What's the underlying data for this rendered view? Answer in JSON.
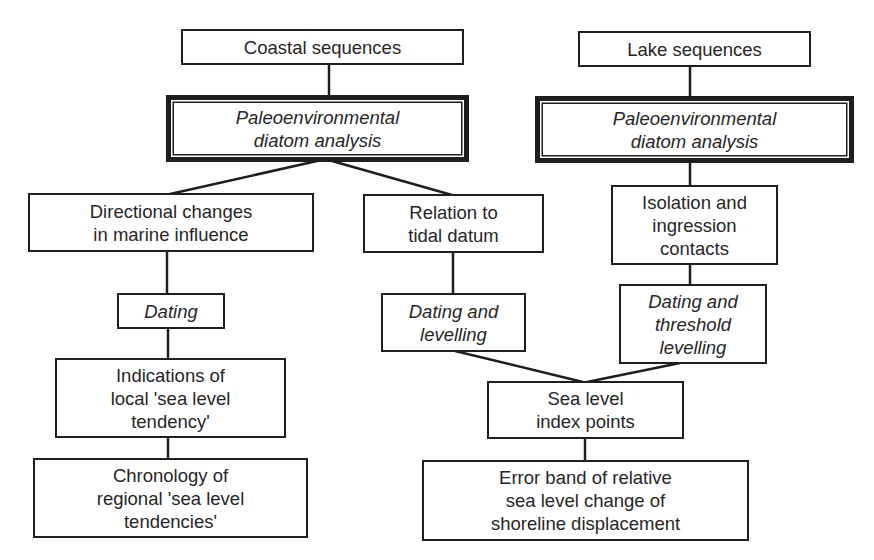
{
  "diagram": {
    "type": "flowchart",
    "nodes": {
      "coastal": {
        "label": "Coastal sequences",
        "style": "normal"
      },
      "lake": {
        "label": "Lake sequences",
        "style": "normal"
      },
      "paleo_left": {
        "label": "Paleoenvironmental\ndiatom analysis",
        "style": "italic-double-border"
      },
      "paleo_right": {
        "label": "Paleoenvironmental\ndiatom analysis",
        "style": "italic-double-border"
      },
      "directional": {
        "label": "Directional changes\nin marine influence",
        "style": "normal"
      },
      "tidal": {
        "label": "Relation to\ntidal datum",
        "style": "normal"
      },
      "isolation": {
        "label": "Isolation and\ningression\ncontacts",
        "style": "normal"
      },
      "dating": {
        "label": "Dating",
        "style": "italic"
      },
      "dating_levelling": {
        "label": "Dating and\nlevelling",
        "style": "italic"
      },
      "dating_threshold": {
        "label": "Dating and\nthreshold\nlevelling",
        "style": "italic"
      },
      "indications": {
        "label": "Indications of\nlocal 'sea level\ntendency'",
        "style": "normal"
      },
      "index_points": {
        "label": "Sea level\nindex points",
        "style": "normal"
      },
      "chronology": {
        "label": "Chronology of\nregional 'sea level\ntendencies'",
        "style": "normal"
      },
      "error_band": {
        "label": "Error band of relative\nsea level change of\nshoreline displacement",
        "style": "normal"
      }
    },
    "edges": [
      [
        "coastal",
        "paleo_left"
      ],
      [
        "lake",
        "paleo_right"
      ],
      [
        "paleo_left",
        "directional"
      ],
      [
        "paleo_left",
        "tidal"
      ],
      [
        "paleo_right",
        "isolation"
      ],
      [
        "directional",
        "dating"
      ],
      [
        "dating",
        "indications"
      ],
      [
        "indications",
        "chronology"
      ],
      [
        "tidal",
        "dating_levelling"
      ],
      [
        "isolation",
        "dating_threshold"
      ],
      [
        "dating_levelling",
        "index_points"
      ],
      [
        "dating_threshold",
        "index_points"
      ],
      [
        "index_points",
        "error_band"
      ]
    ],
    "colors": {
      "line": "#1e1e1e",
      "text": "#262626",
      "background": "#ffffff"
    }
  }
}
